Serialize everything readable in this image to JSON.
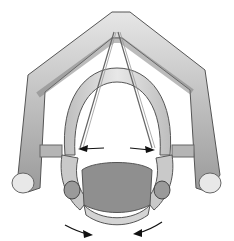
{
  "illustration": {
    "subject": "larynx-superior-view",
    "colors": {
      "background": "#ffffff",
      "cartilage_light": "#d9d9d9",
      "cartilage_mid": "#a8a8a8",
      "cartilage_dark": "#6e6e6e",
      "outline": "#4a4a4a",
      "arrow": "#111111"
    },
    "arrows": [
      {
        "name": "arrow-left-abduction",
        "direction": "left"
      },
      {
        "name": "arrow-right-abduction",
        "direction": "right"
      },
      {
        "name": "arrow-bottom-left-rotation",
        "direction": "down-right"
      },
      {
        "name": "arrow-bottom-right-rotation",
        "direction": "down-left"
      }
    ]
  }
}
